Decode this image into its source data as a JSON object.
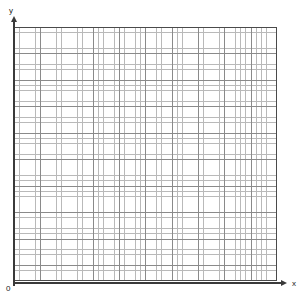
{
  "figure": {
    "name": "blank-cartesian-graph-paper",
    "background_color": "#ffffff"
  },
  "axes": {
    "y": {
      "label": "y",
      "arrow": "arrow-up",
      "line_color": "#3a3a3a"
    },
    "x": {
      "label": "x",
      "arrow": "arrow-right",
      "line_color": "#3a3a3a"
    },
    "origin": {
      "label": "0"
    }
  },
  "grid": {
    "minor_color": "#b9b9b9",
    "major_color": "#8a8a8a",
    "border_color": "#4a4a4a",
    "minor_cells_x": 50,
    "minor_cells_y": 48,
    "major_every": 5
  },
  "chart_data": {
    "type": "scatter",
    "title": "",
    "xlabel": "x",
    "ylabel": "y",
    "series": [],
    "x": [],
    "values": [],
    "grid": true,
    "legend": "none",
    "xlim": [
      0,
      50
    ],
    "ylim": [
      0,
      48
    ],
    "xticks": [],
    "yticks": []
  }
}
